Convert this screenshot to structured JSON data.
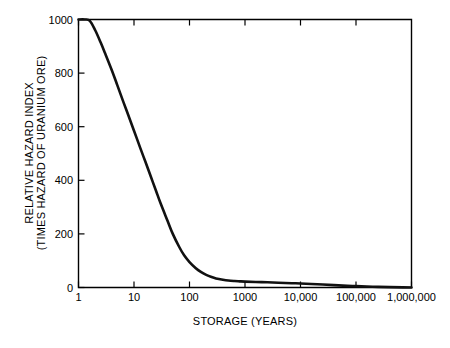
{
  "chart_data": {
    "type": "line",
    "title": "",
    "xlabel": "STORAGE (YEARS)",
    "ylabel_line1": "RELATIVE HAZARD INDEX",
    "ylabel_line2": "(TIMES HAZARD OF URANIUM ORE)",
    "xscale": "log",
    "yscale": "linear",
    "xlim": [
      1,
      1000000
    ],
    "ylim": [
      0,
      1000
    ],
    "grid": false,
    "legend": "none",
    "xticks": [
      1,
      10,
      100,
      1000,
      10000,
      100000,
      1000000
    ],
    "xticklabels": [
      "1",
      "10",
      "100",
      "1000",
      "10,000",
      "100,000",
      "1,000,000"
    ],
    "yticks": [
      0,
      200,
      400,
      600,
      800,
      1000
    ],
    "yticklabels": [
      "0",
      "200",
      "400",
      "600",
      "800",
      "1000"
    ],
    "series": [
      {
        "name": "Relative hazard index of spent fuel",
        "color": "#111111",
        "x": [
          1,
          1.3,
          1.6,
          2,
          2.5,
          3,
          4,
          5,
          6.5,
          8,
          10,
          13,
          16,
          20,
          25,
          30,
          40,
          50,
          65,
          80,
          100,
          130,
          160,
          200,
          250,
          300,
          400,
          500,
          650,
          800,
          1000,
          2000,
          4000,
          7000,
          10000,
          20000,
          40000,
          70000,
          100000,
          200000,
          400000,
          700000,
          1000000
        ],
        "y": [
          1000,
          1000,
          995,
          960,
          915,
          875,
          810,
          755,
          690,
          640,
          585,
          520,
          470,
          415,
          360,
          315,
          250,
          200,
          152,
          120,
          95,
          72,
          58,
          47,
          39,
          34,
          29,
          26,
          24,
          23,
          22,
          20,
          18,
          16,
          15,
          12,
          9,
          6,
          5,
          3,
          1.5,
          0.6,
          0
        ]
      }
    ]
  },
  "axes": {
    "x_tick_count": 7,
    "y_tick_count": 6
  }
}
